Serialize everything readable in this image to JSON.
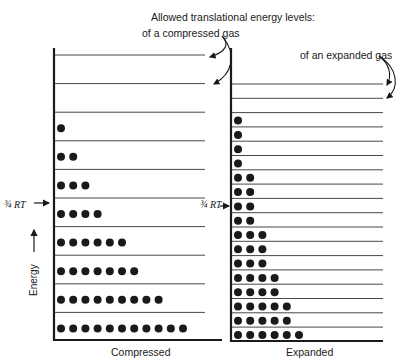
{
  "title": "Allowed translational energy levels:",
  "compressed_annotation": "of a compressed gas",
  "expanded_annotation": "of an expanded gas",
  "axis_label": "Energy",
  "rt_label": "¾ RT",
  "rt_label_display": "¾ RT →",
  "panels": {
    "compressed": {
      "label": "Compressed",
      "levels_top_to_bottom": [
        0,
        0,
        1,
        2,
        3,
        4,
        6,
        7,
        9,
        11
      ],
      "rt_marker_after_level_index": 5
    },
    "expanded": {
      "label": "Expanded",
      "levels_top_to_bottom": [
        0,
        0,
        1,
        1,
        1,
        1,
        2,
        2,
        2,
        2,
        3,
        3,
        3,
        4,
        4,
        5,
        5,
        6
      ],
      "rt_marker_level_index": 9
    }
  },
  "colors": {
    "ink": "#1a1a1a",
    "line": "#333333",
    "background": "#ffffff"
  }
}
